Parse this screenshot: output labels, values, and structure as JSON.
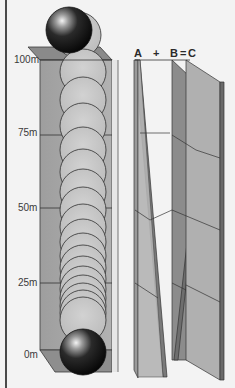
{
  "figure": {
    "height_scale": {
      "labels": [
        "100m",
        "75m",
        "50m",
        "25m",
        "0m"
      ],
      "unit": "m"
    },
    "equation": {
      "a": "A",
      "plus": "+",
      "b": "B",
      "equals": "=",
      "c": "C"
    },
    "colors": {
      "background": "#f3f3f3",
      "column_face": "#a8a8a8",
      "column_side": "#8c8c8c",
      "ball_dark": "#111111",
      "ghost_ball": "#c4c4c4",
      "outline": "#333333"
    }
  }
}
